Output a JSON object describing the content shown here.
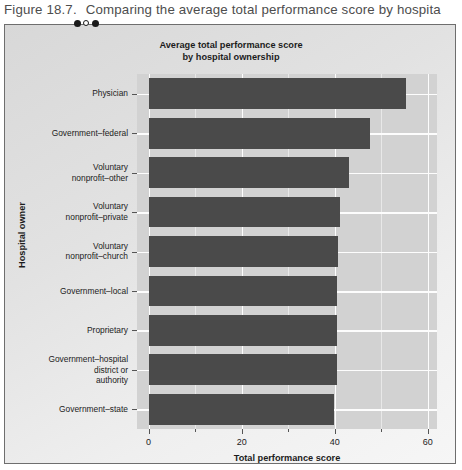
{
  "figure": {
    "caption_number": "Figure 18.7.",
    "caption_text": "Comparing the average total performance score by hospita"
  },
  "chart_data": {
    "type": "bar",
    "orientation": "horizontal",
    "title": "Average total performance score by hospital ownership",
    "title_line1": "Average total performance score",
    "title_line2": "by hospital ownership",
    "xlabel": "Total performance score",
    "ylabel": "Hospital owner",
    "xlim": [
      -2.5,
      62
    ],
    "xticks": [
      0,
      20,
      40,
      60
    ],
    "xtick_labels": [
      "0",
      "20",
      "40",
      "60"
    ],
    "xminor_ticks": [
      10,
      30,
      50
    ],
    "grid": true,
    "legend": "none",
    "bar_color": "#4a4a4a",
    "panel_color": "#d2d2d2",
    "categories": [
      "Physician",
      "Government–federal",
      "Voluntary\nnonprofit–other",
      "Voluntary\nnonprofit–private",
      "Voluntary\nnonprofit–church",
      "Government–local",
      "Proprietary",
      "Government–hospital\ndistrict or\nauthority",
      "Government–state"
    ],
    "values": [
      55.3,
      47.7,
      43.0,
      41.2,
      40.8,
      40.6,
      40.5,
      40.4,
      39.8
    ]
  }
}
